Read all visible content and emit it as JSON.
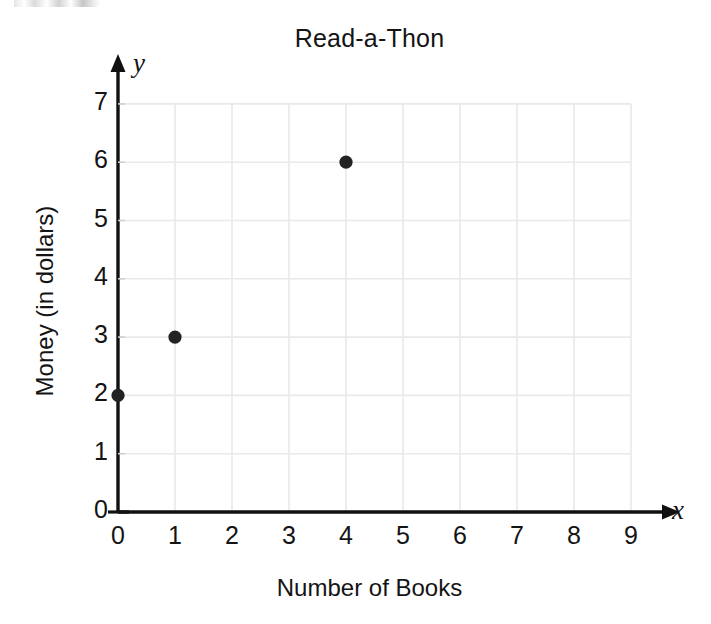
{
  "chart_data": {
    "type": "scatter",
    "title": "Read-a-Thon",
    "xlabel": "Number of Books",
    "ylabel": "Money (in dollars)",
    "x_axis_letter": "x",
    "y_axis_letter": "y",
    "xlim": [
      0,
      9
    ],
    "ylim": [
      0,
      7
    ],
    "xticks": [
      "0",
      "1",
      "2",
      "3",
      "4",
      "5",
      "6",
      "7",
      "8",
      "9"
    ],
    "yticks": [
      "0",
      "1",
      "2",
      "3",
      "4",
      "5",
      "6",
      "7"
    ],
    "grid": true,
    "legend": null,
    "points": [
      {
        "x": 0,
        "y": 2
      },
      {
        "x": 1,
        "y": 3
      },
      {
        "x": 4,
        "y": 6
      }
    ],
    "marker_color": "#222222",
    "grid_color": "#e9e9e9",
    "axis_color": "#111111"
  }
}
